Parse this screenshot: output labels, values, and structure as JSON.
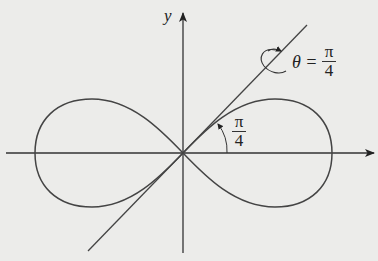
{
  "diagram": {
    "axes": {
      "y_label": "y"
    },
    "tangent_label": {
      "lhs": "θ =",
      "num": "π",
      "den": "4"
    },
    "angle_label": {
      "num": "π",
      "den": "4"
    },
    "colors": {
      "background": "#ececea",
      "stroke": "#444444"
    }
  }
}
